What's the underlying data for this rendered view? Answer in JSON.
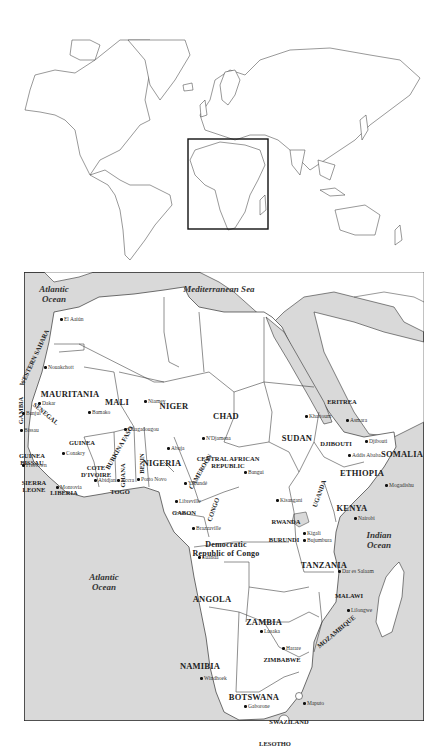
{
  "world_map": {
    "highlight_box": {
      "label": "Africa inset",
      "x": 188,
      "y": 139,
      "w": 80,
      "h": 90
    }
  },
  "africa_map": {
    "water": [
      {
        "name": "Atlantic Ocean",
        "line1": "Atlantic",
        "line2": "Ocean",
        "x": 30,
        "y": 12
      },
      {
        "name": "Mediterranean Sea",
        "line1": "Mediterranean Sea",
        "line2": "",
        "x": 195,
        "y": 12
      },
      {
        "name": "Indian Ocean",
        "line1": "Indian",
        "line2": "Ocean",
        "x": 355,
        "y": 258
      },
      {
        "name": "Atlantic Ocean south",
        "line1": "Atlantic",
        "line2": "Ocean",
        "x": 80,
        "y": 300
      }
    ],
    "countries": [
      {
        "name": "WESTERN SAHARA",
        "x": 10,
        "y": 82,
        "rot": -65,
        "small": true
      },
      {
        "name": "MAURITANIA",
        "x": 46,
        "y": 118
      },
      {
        "name": "MALI",
        "x": 93,
        "y": 126
      },
      {
        "name": "NIGER",
        "x": 150,
        "y": 130
      },
      {
        "name": "CHAD",
        "x": 202,
        "y": 140
      },
      {
        "name": "SUDAN",
        "x": 273,
        "y": 162
      },
      {
        "name": "ERITREA",
        "x": 318,
        "y": 126,
        "small": true
      },
      {
        "name": "DJIBOUTI",
        "x": 312,
        "y": 168,
        "small": true
      },
      {
        "name": "SOMALIA",
        "x": 378,
        "y": 178
      },
      {
        "name": "ETHIOPIA",
        "x": 338,
        "y": 197
      },
      {
        "name": "GAMBIA",
        "x": -4,
        "y": 135,
        "rot": -90,
        "small": true
      },
      {
        "name": "SENEGAL",
        "x": 22,
        "y": 138,
        "rot": 40,
        "small": true
      },
      {
        "name": "GUINEA",
        "x": 58,
        "y": 167,
        "small": true
      },
      {
        "name": "GUINEA BISSAU",
        "x": 8,
        "y": 180,
        "small": true,
        "two": [
          "GUINEA",
          "BISSAU"
        ]
      },
      {
        "name": "SIERRA LEONE",
        "x": 10,
        "y": 207,
        "small": true,
        "two": [
          "SIERRA",
          "LEONE"
        ]
      },
      {
        "name": "LIBERIA",
        "x": 40,
        "y": 217,
        "small": true
      },
      {
        "name": "COTE D'IVOIRE",
        "x": 72,
        "y": 192,
        "small": true,
        "two": [
          "COTE",
          "D'IVOIRE"
        ]
      },
      {
        "name": "BURKINA FASO",
        "x": 95,
        "y": 172,
        "rot": -60,
        "small": true
      },
      {
        "name": "GHANA",
        "x": 98,
        "y": 200,
        "rot": -90,
        "small": true
      },
      {
        "name": "TOGO",
        "x": 96,
        "y": 216,
        "small": true
      },
      {
        "name": "BENIN",
        "x": 117,
        "y": 188,
        "rot": -90,
        "small": true
      },
      {
        "name": "NIGERIA",
        "x": 138,
        "y": 187
      },
      {
        "name": "CAMEROON",
        "x": 176,
        "y": 196,
        "rot": -60,
        "small": true
      },
      {
        "name": "CENTRAL AFRICAN REPUBLIC",
        "x": 204,
        "y": 183,
        "small": true,
        "two": [
          "CENTRAL AFRICAN",
          "REPUBLIC"
        ]
      },
      {
        "name": "GABON",
        "x": 160,
        "y": 237,
        "small": true
      },
      {
        "name": "CONGO",
        "x": 189,
        "y": 234,
        "rot": -70,
        "small": true
      },
      {
        "name": "Democratic Republic of Congo",
        "x": 202,
        "y": 268,
        "two": [
          "Democratic",
          "Republic of Congo"
        ],
        "sentence": true
      },
      {
        "name": "RWANDA",
        "x": 262,
        "y": 246,
        "small": true
      },
      {
        "name": "BURUNDI",
        "x": 260,
        "y": 264,
        "small": true
      },
      {
        "name": "UGANDA",
        "x": 295,
        "y": 218,
        "rot": -70,
        "small": true
      },
      {
        "name": "KENYA",
        "x": 328,
        "y": 232
      },
      {
        "name": "TANZANIA",
        "x": 300,
        "y": 289
      },
      {
        "name": "MALAWI",
        "x": 325,
        "y": 320,
        "small": true
      },
      {
        "name": "ANGOLA",
        "x": 188,
        "y": 323
      },
      {
        "name": "ZAMBIA",
        "x": 240,
        "y": 346
      },
      {
        "name": "MOZAMBIQUE",
        "x": 312,
        "y": 356,
        "rot": -40,
        "small": true
      },
      {
        "name": "ZIMBABWE",
        "x": 258,
        "y": 384,
        "small": true
      },
      {
        "name": "NAMIBIA",
        "x": 176,
        "y": 390
      },
      {
        "name": "BOTSWANA",
        "x": 230,
        "y": 421
      },
      {
        "name": "SWAZILAND",
        "x": 265,
        "y": 446,
        "small": true
      },
      {
        "name": "LESOTHO",
        "x": 251,
        "y": 468,
        "small": true
      },
      {
        "name": "SOUTH AFRICA",
        "x": 234,
        "y": 495
      }
    ],
    "cities": [
      {
        "name": "El Aaiún",
        "x": 40,
        "y": 44
      },
      {
        "name": "Nouakchott",
        "x": 24,
        "y": 92
      },
      {
        "name": "Bamako",
        "x": 68,
        "y": 137
      },
      {
        "name": "Niamey",
        "x": 124,
        "y": 126
      },
      {
        "name": "Dakar",
        "x": 18,
        "y": 128
      },
      {
        "name": "Banjul",
        "x": 2,
        "y": 138
      },
      {
        "name": "Bissau",
        "x": 0,
        "y": 155
      },
      {
        "name": "Conakry",
        "x": 42,
        "y": 178
      },
      {
        "name": "Freetown",
        "x": 2,
        "y": 190
      },
      {
        "name": "Monrovia",
        "x": 36,
        "y": 212
      },
      {
        "name": "Ouagadougou",
        "x": 104,
        "y": 154
      },
      {
        "name": "Abidjan",
        "x": 74,
        "y": 205
      },
      {
        "name": "Accra",
        "x": 97,
        "y": 205
      },
      {
        "name": "Porto Novo",
        "x": 117,
        "y": 204
      },
      {
        "name": "Abuja",
        "x": 147,
        "y": 173
      },
      {
        "name": "N'Djamena",
        "x": 182,
        "y": 163
      },
      {
        "name": "Bangui",
        "x": 224,
        "y": 197
      },
      {
        "name": "Yaoundé",
        "x": 164,
        "y": 208
      },
      {
        "name": "Libreville",
        "x": 155,
        "y": 226
      },
      {
        "name": "Brazzaville",
        "x": 172,
        "y": 253
      },
      {
        "name": "Kisangani",
        "x": 256,
        "y": 225
      },
      {
        "name": "Khartoum",
        "x": 285,
        "y": 141
      },
      {
        "name": "Asmara",
        "x": 326,
        "y": 145
      },
      {
        "name": "Djibouti",
        "x": 345,
        "y": 166
      },
      {
        "name": "Addis Ababa",
        "x": 328,
        "y": 180
      },
      {
        "name": "Mogadishu",
        "x": 365,
        "y": 210
      },
      {
        "name": "Nairobi",
        "x": 334,
        "y": 243
      },
      {
        "name": "Kigali",
        "x": 283,
        "y": 258
      },
      {
        "name": "Bujumbura",
        "x": 283,
        "y": 265
      },
      {
        "name": "Dar es Salaam",
        "x": 318,
        "y": 296
      },
      {
        "name": "Lilongwe",
        "x": 327,
        "y": 335
      },
      {
        "name": "Luanda",
        "x": 178,
        "y": 282
      },
      {
        "name": "Lusaka",
        "x": 240,
        "y": 356
      },
      {
        "name": "Harare",
        "x": 262,
        "y": 373
      },
      {
        "name": "Windhoek",
        "x": 180,
        "y": 403
      },
      {
        "name": "Gaborone",
        "x": 224,
        "y": 431
      },
      {
        "name": "Maputo",
        "x": 283,
        "y": 428
      },
      {
        "name": "Cape Town",
        "x": 212,
        "y": 512
      }
    ]
  }
}
